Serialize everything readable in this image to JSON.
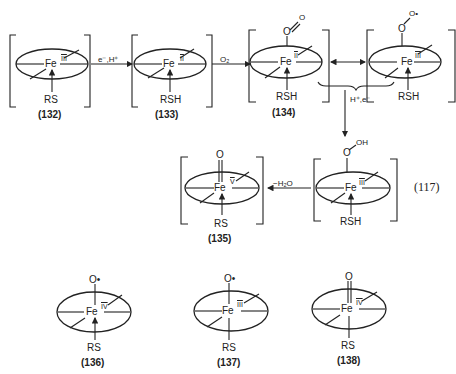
{
  "diagram": {
    "equation_number": "(117)",
    "compounds": [
      {
        "id": "(132)",
        "metal": "Fe",
        "oxidation": "III",
        "axial_top": "",
        "axial_bottom": "RS"
      },
      {
        "id": "(133)",
        "metal": "Fe",
        "oxidation": "II",
        "axial_top": "",
        "axial_bottom": "RSH"
      },
      {
        "id": "(134)",
        "metal": "Fe",
        "oxidation": "II",
        "axial_top": "O=O",
        "axial_bottom": "RSH"
      },
      {
        "id": "",
        "metal": "Fe",
        "oxidation": "III",
        "axial_top": "O-O•",
        "axial_bottom": "RSH"
      },
      {
        "id": "",
        "metal": "Fe",
        "oxidation": "III",
        "axial_top": "O-OH",
        "axial_bottom": "RSH"
      },
      {
        "id": "(135)",
        "metal": "Fe",
        "oxidation": "V",
        "axial_top": "O",
        "axial_bottom": "RS"
      },
      {
        "id": "(136)",
        "metal": "Fe",
        "oxidation": "IV",
        "axial_top": "O•",
        "axial_bottom": "RS"
      },
      {
        "id": "(137)",
        "metal": "Fe",
        "oxidation": "III",
        "axial_top": "O•",
        "axial_bottom": "RS"
      },
      {
        "id": "(138)",
        "metal": "Fe",
        "oxidation": "IV",
        "axial_top": "O",
        "axial_bottom": "RS"
      }
    ],
    "arrows": {
      "a1": "e⁻,H⁺",
      "a2": "O₂",
      "a3": "H⁺,e⁻",
      "a4": "−H₂O"
    },
    "labels": {
      "fe": "Fe",
      "o": "O",
      "o_rad": "O•",
      "oh": "OH",
      "rs": "RS",
      "rsh": "RSH"
    }
  }
}
